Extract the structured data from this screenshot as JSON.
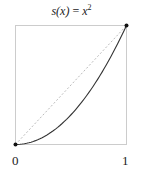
{
  "chart_data": {
    "type": "line",
    "title_parts": {
      "lhs": "s(x)",
      "eq": " = ",
      "base": "x",
      "exp": "2"
    },
    "xlabel": "",
    "ylabel": "",
    "xlim": [
      0,
      1
    ],
    "ylim": [
      0,
      1
    ],
    "x_tick_labels": [
      "0",
      "1"
    ],
    "grid": false,
    "legend": null,
    "series": [
      {
        "name": "s(x) = x^2",
        "style": "solid",
        "color": "#333333",
        "x": [
          0,
          0.1,
          0.2,
          0.3,
          0.4,
          0.5,
          0.6,
          0.7,
          0.8,
          0.9,
          1.0
        ],
        "y": [
          0,
          0.01,
          0.04,
          0.09,
          0.16,
          0.25,
          0.36,
          0.49,
          0.64,
          0.81,
          1.0
        ]
      },
      {
        "name": "identity y = x",
        "style": "dotted",
        "color": "#bbbbbb",
        "x": [
          0,
          1
        ],
        "y": [
          0,
          1
        ]
      }
    ],
    "points": [
      {
        "x": 0,
        "y": 0
      },
      {
        "x": 1,
        "y": 1
      }
    ],
    "colors": {
      "frame": "#cccccc",
      "curve": "#333333",
      "diagonal": "#bbbbbb",
      "points": "#111111"
    }
  }
}
